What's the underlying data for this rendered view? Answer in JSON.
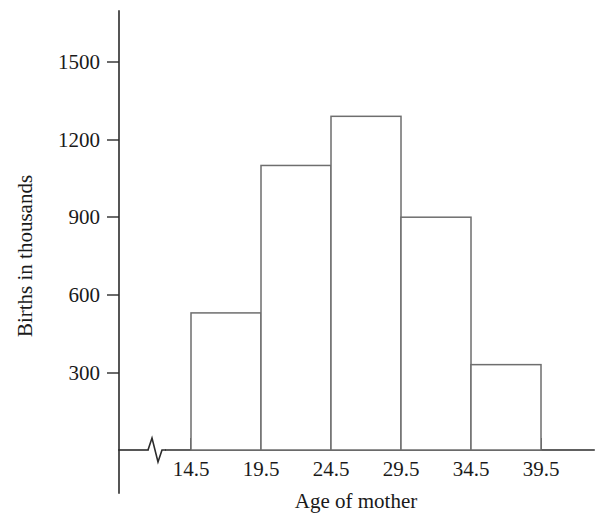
{
  "chart_data": {
    "type": "bar",
    "title": "",
    "subtitle": "",
    "xlabel": "Age of mother",
    "ylabel": "Births in thousands",
    "categories": [
      "14.5-19.5",
      "19.5-24.5",
      "24.5-29.5",
      "29.5-34.5",
      "34.5-39.5"
    ],
    "bin_edges": [
      14.5,
      19.5,
      24.5,
      29.5,
      34.5,
      39.5
    ],
    "values": [
      530,
      1100,
      1290,
      900,
      330
    ],
    "bin_width": 5,
    "xtick_labels": [
      "14.5",
      "19.5",
      "24.5",
      "29.5",
      "34.5",
      "39.5"
    ],
    "ytick_labels": [
      "300",
      "600",
      "900",
      "1200",
      "1500"
    ],
    "ytick_values": [
      300,
      600,
      900,
      1200,
      1500
    ],
    "ylim": [
      0,
      1650
    ],
    "xlim": [
      14.5,
      39.5
    ],
    "grid": false,
    "legend": false,
    "legend_position": "none",
    "axis_break": "x-axis zigzag break between origin and first bin",
    "colors": {
      "bar_fill": "#ffffff",
      "bar_stroke": "#6e6e6e",
      "axis": "#2b2b2b",
      "text": "#1a1a1a",
      "background": "#ffffff"
    }
  },
  "axes": {
    "y_title": "Births in thousands",
    "x_title": "Age of mother",
    "y_ticks": [
      {
        "label": "1500",
        "value": 1500
      },
      {
        "label": "1200",
        "value": 1200
      },
      {
        "label": "900",
        "value": 900
      },
      {
        "label": "600",
        "value": 600
      },
      {
        "label": "300",
        "value": 300
      }
    ],
    "x_ticks": [
      {
        "label": "14.5",
        "value": 14.5
      },
      {
        "label": "19.5",
        "value": 19.5
      },
      {
        "label": "24.5",
        "value": 24.5
      },
      {
        "label": "29.5",
        "value": 29.5
      },
      {
        "label": "34.5",
        "value": 34.5
      },
      {
        "label": "39.5",
        "value": 39.5
      }
    ]
  },
  "bars": [
    {
      "label": "14.5-19.5",
      "value": 530
    },
    {
      "label": "19.5-24.5",
      "value": 1100
    },
    {
      "label": "24.5-29.5",
      "value": 1290
    },
    {
      "label": "29.5-34.5",
      "value": 900
    },
    {
      "label": "34.5-39.5",
      "value": 330
    }
  ]
}
